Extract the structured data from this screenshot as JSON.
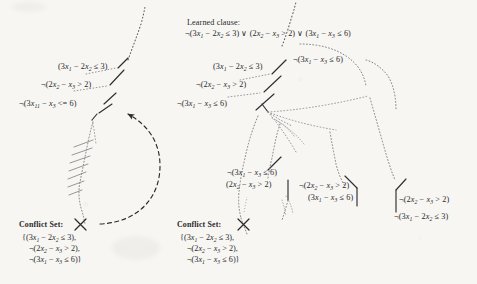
{
  "figure": {
    "kind": "dpll-t-search-tree-diagram",
    "background_color": "#f7f6f3",
    "ink_color": "#29292b"
  },
  "learned_clause": {
    "header": "Learned clause:",
    "clause": "¬(3x1 − 2x2 ≤ 3) ∨ (2x2 − x3 > 2) ∨ (3x1 − x3 ≤ 6)"
  },
  "left_tree": {
    "labels": [
      {
        "id": "l1",
        "text": "(3x1 − 2x2 ≤ 3)"
      },
      {
        "id": "l2",
        "text": "¬(2x2 − x3 > 2)"
      },
      {
        "id": "l3",
        "text": "¬(3x11 − x3 <= 6)"
      }
    ],
    "conflict_set": {
      "name": "Conflict Set:",
      "mark": "x-mark",
      "lines": [
        "{(3x1 − 2x2 ≤ 3),",
        "¬(2x2 − x3 > 2),",
        "¬(3x1 − x3 ≤ 6)}"
      ]
    },
    "backjump_arrow": "dashed-curved-arrow"
  },
  "right_tree": {
    "labels": [
      {
        "id": "r1",
        "text": "(3x1 − 2x2 ≤ 3)"
      },
      {
        "id": "r2",
        "text": "¬(2x2 − x3 > 2)"
      },
      {
        "id": "r3",
        "text": "¬(3x1 − x3 ≤ 6)"
      },
      {
        "id": "r4",
        "text": "¬(3x1 − x3 ≤ 6)"
      },
      {
        "id": "r5",
        "text": "¬(3x1 − x3 ≤ 6)"
      },
      {
        "id": "r6",
        "text": "(2x2 − x3 > 2)"
      },
      {
        "id": "r7",
        "text": "¬(2x2 − x3 > 2)"
      },
      {
        "id": "r8",
        "text": "(3x1 − x3 ≤ 6)"
      },
      {
        "id": "r9",
        "text": "¬(2x2 − x3 > 2)"
      },
      {
        "id": "r10",
        "text": "¬(3x1 − 2x2 ≤ 3)"
      }
    ],
    "conflict_set": {
      "name": "Conflict Set:",
      "mark": "x-mark",
      "lines": [
        "{(3x1 − 2x2 ≤ 3),",
        "¬(2x2 − x3 > 2),",
        "¬(3x1 − x3 ≤ 6)}"
      ]
    }
  }
}
